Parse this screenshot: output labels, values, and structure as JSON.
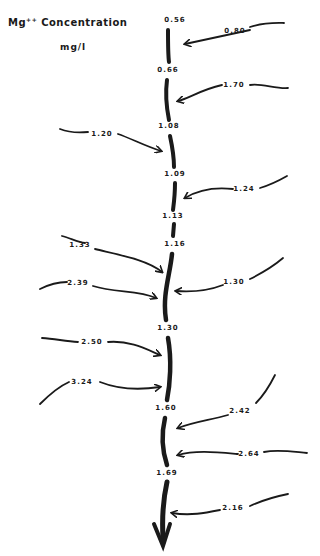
{
  "title": {
    "prefix": "Mg",
    "superscript": "++",
    "suffix": " Concentration"
  },
  "unit": "mg/l",
  "main_channel_labels": [
    {
      "value": "0.56",
      "x": 175,
      "y": 20
    },
    {
      "value": "0.66",
      "x": 168,
      "y": 70
    },
    {
      "value": "1.08",
      "x": 169,
      "y": 126
    },
    {
      "value": "1.09",
      "x": 175,
      "y": 174
    },
    {
      "value": "1.13",
      "x": 173,
      "y": 216
    },
    {
      "value": "1.16",
      "x": 175,
      "y": 244
    },
    {
      "value": "1.30",
      "x": 168,
      "y": 328
    },
    {
      "value": "1.60",
      "x": 166,
      "y": 408
    },
    {
      "value": "1.69",
      "x": 167,
      "y": 473
    }
  ],
  "tributary_labels": [
    {
      "value": "0.80",
      "x": 235,
      "y": 31
    },
    {
      "value": "1.70",
      "x": 234,
      "y": 85
    },
    {
      "value": "1.20",
      "x": 102,
      "y": 134
    },
    {
      "value": "1.24",
      "x": 244,
      "y": 189
    },
    {
      "value": "1.33",
      "x": 80,
      "y": 245
    },
    {
      "value": "2.39",
      "x": 78,
      "y": 283
    },
    {
      "value": "1.30",
      "x": 234,
      "y": 282
    },
    {
      "value": "2.50",
      "x": 92,
      "y": 342
    },
    {
      "value": "3.24",
      "x": 82,
      "y": 382
    },
    {
      "value": "2.42",
      "x": 240,
      "y": 411
    },
    {
      "value": "2.64",
      "x": 249,
      "y": 454
    },
    {
      "value": "2.16",
      "x": 233,
      "y": 508
    }
  ]
}
